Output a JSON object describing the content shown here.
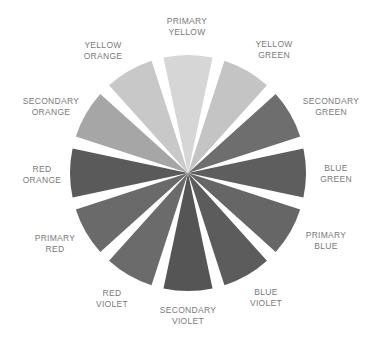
{
  "diagram": {
    "type": "color-wheel",
    "center": [
      188,
      173
    ],
    "radius": 118,
    "wedge_span_deg": 24,
    "segments": [
      {
        "id": "primary-yellow",
        "line1": "PRIMARY",
        "line2": "YELLOW",
        "angle": 0,
        "shade": "#d6d6d6",
        "label_pos": [
          187,
          27
        ]
      },
      {
        "id": "yellow-green",
        "line1": "YELLOW",
        "line2": "GREEN",
        "angle": 30,
        "shade": "#c4c4c4",
        "label_pos": [
          274,
          50
        ]
      },
      {
        "id": "secondary-green",
        "line1": "SECONDARY",
        "line2": "GREEN",
        "angle": 60,
        "shade": "#6e6e6e",
        "label_pos": [
          331,
          107
        ]
      },
      {
        "id": "blue-green",
        "line1": "BLUE",
        "line2": "GREEN",
        "angle": 90,
        "shade": "#5e5e5e",
        "label_pos": [
          336,
          174
        ]
      },
      {
        "id": "primary-blue",
        "line1": "PRIMARY",
        "line2": "BLUE",
        "angle": 120,
        "shade": "#666666",
        "label_pos": [
          326,
          241
        ]
      },
      {
        "id": "blue-violet",
        "line1": "BLUE",
        "line2": "VIOLET",
        "angle": 150,
        "shade": "#5c5c5c",
        "label_pos": [
          266,
          298
        ]
      },
      {
        "id": "secondary-violet",
        "line1": "SECONDARY",
        "line2": "VIOLET",
        "angle": 180,
        "shade": "#555555",
        "label_pos": [
          188,
          316
        ]
      },
      {
        "id": "red-violet",
        "line1": "RED",
        "line2": "VIOLET",
        "angle": 210,
        "shade": "#6b6b6b",
        "label_pos": [
          112,
          299
        ]
      },
      {
        "id": "primary-red",
        "line1": "PRIMARY",
        "line2": "RED",
        "angle": 240,
        "shade": "#6a6a6a",
        "label_pos": [
          55,
          244
        ]
      },
      {
        "id": "red-orange",
        "line1": "RED",
        "line2": "ORANGE",
        "angle": 270,
        "shade": "#5a5a5a",
        "label_pos": [
          42,
          175
        ]
      },
      {
        "id": "secondary-orange",
        "line1": "SECONDARY",
        "line2": "ORANGE",
        "angle": 300,
        "shade": "#a6a6a6",
        "label_pos": [
          51,
          107
        ]
      },
      {
        "id": "yellow-orange",
        "line1": "YELLOW",
        "line2": "ORANGE",
        "angle": 330,
        "shade": "#c8c8c8",
        "label_pos": [
          103,
          51
        ]
      }
    ]
  }
}
